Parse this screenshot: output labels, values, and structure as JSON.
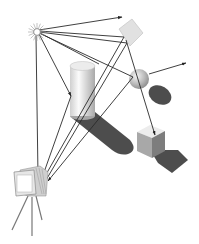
{
  "diagram": {
    "title": "Ray tracing illustration",
    "elements": [
      {
        "name": "light-source",
        "shape": "starburst",
        "x": 37,
        "y": 32
      },
      {
        "name": "translucent-panel",
        "shape": "tilted square",
        "x": 130,
        "y": 32
      },
      {
        "name": "sphere",
        "shape": "sphere",
        "x": 140,
        "y": 77
      },
      {
        "name": "cylinder",
        "shape": "cylinder",
        "x": 83,
        "y": 90
      },
      {
        "name": "cube",
        "shape": "cube",
        "x": 155,
        "y": 140
      },
      {
        "name": "camera",
        "shape": "camera on tripod",
        "x": 30,
        "y": 190
      }
    ],
    "colors": {
      "ray": "#2a2a2a",
      "shadow": "#4a4a4a",
      "panel": "#dcdcdc",
      "object_light": "#f2f2f2",
      "object_mid": "#bdbdbd",
      "object_dark": "#8a8a8a"
    }
  }
}
